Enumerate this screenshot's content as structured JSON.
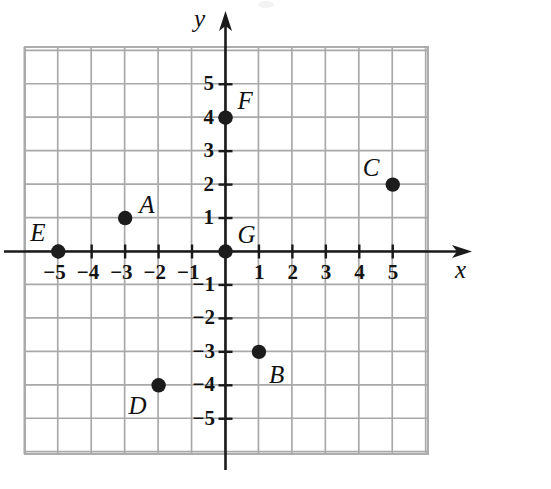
{
  "figure": {
    "kind": "coordinate-plane-scatter",
    "background_color": "#ffffff",
    "grid_color": "#a9a9a9",
    "axis_color": "#1a1a1a",
    "point_color": "#1c1c1c"
  },
  "axes": {
    "x_label": "x",
    "y_label": "y",
    "x_ticks_negative": [
      "−5",
      "−4",
      "−3",
      "−2",
      "−1"
    ],
    "x_ticks_positive": [
      "1",
      "2",
      "3",
      "4",
      "5"
    ],
    "y_ticks_positive": [
      "1",
      "2",
      "3",
      "4",
      "5"
    ],
    "y_ticks_negative": [
      "−1",
      "−2",
      "−3",
      "−4",
      "−5"
    ]
  },
  "chart_data": {
    "type": "scatter",
    "title": "",
    "xlabel": "x",
    "ylabel": "y",
    "xlim": [
      -5.7,
      6.3
    ],
    "ylim": [
      -6.0,
      6.2
    ],
    "grid": true,
    "legend": "none",
    "x_tick_values": [
      -5,
      -4,
      -3,
      -2,
      -1,
      1,
      2,
      3,
      4,
      5
    ],
    "y_tick_values": [
      5,
      4,
      3,
      2,
      1,
      -1,
      -2,
      -3,
      -4,
      -5
    ],
    "points": [
      {
        "label": "A",
        "x": -3,
        "y": 1,
        "label_dx": 14,
        "label_dy": -26
      },
      {
        "label": "B",
        "x": 1,
        "y": -3,
        "label_dx": 10,
        "label_dy": 10
      },
      {
        "label": "C",
        "x": 5,
        "y": 2,
        "label_dx": -30,
        "label_dy": -30
      },
      {
        "label": "D",
        "x": -2,
        "y": -4,
        "label_dx": -30,
        "label_dy": 8
      },
      {
        "label": "E",
        "x": -5,
        "y": 0,
        "label_dx": -28,
        "label_dy": -32
      },
      {
        "label": "F",
        "x": 0,
        "y": 4,
        "label_dx": 12,
        "label_dy": -30
      },
      {
        "label": "G",
        "x": 0,
        "y": 0,
        "label_dx": 12,
        "label_dy": -30
      }
    ]
  }
}
